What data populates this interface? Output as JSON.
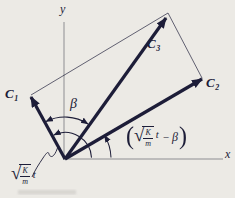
{
  "colors": {
    "ink": "#1d1d38",
    "axis": "#8e8e92",
    "background": "#eceae5",
    "smudge": "#c6c4c0"
  },
  "diagram": {
    "y_axis_label": "y",
    "x_axis_label": "x",
    "beta_label": "β",
    "vectors": [
      {
        "name": "C1",
        "base": "C",
        "sub": "1"
      },
      {
        "name": "C2",
        "base": "C",
        "sub": "2"
      },
      {
        "name": "C3",
        "base": "C",
        "sub": "3"
      }
    ],
    "origin_phase_label": {
      "radicand_num": "K",
      "radicand_den": "m",
      "variable": "t"
    },
    "c2_phase_label": {
      "open_paren": "(",
      "radicand_num": "K",
      "radicand_den": "m",
      "variable": "t",
      "minus_sign": "−",
      "beta": "β",
      "close_paren": ")"
    }
  }
}
